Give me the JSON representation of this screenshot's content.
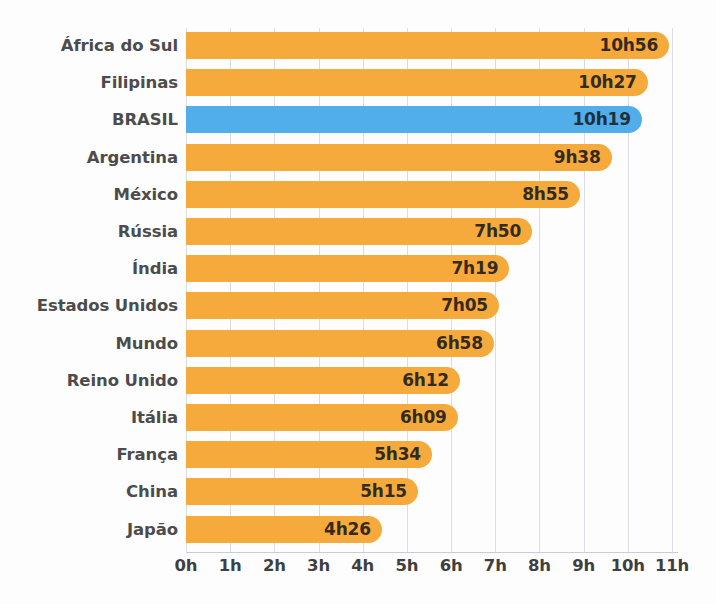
{
  "chart_data": {
    "type": "bar",
    "orientation": "horizontal",
    "title": "",
    "subtitle": "",
    "xlabel": "",
    "ylabel": "",
    "grid": true,
    "legend_position": "none",
    "xlim": [
      0,
      11
    ],
    "x_tick_labels": [
      "0h",
      "1h",
      "2h",
      "3h",
      "4h",
      "5h",
      "6h",
      "7h",
      "8h",
      "9h",
      "10h",
      "11h"
    ],
    "x_tick_values": [
      0,
      1,
      2,
      3,
      4,
      5,
      6,
      7,
      8,
      9,
      10,
      11
    ],
    "unit": "hours",
    "categories": [
      "África do Sul",
      "Filipinas",
      "BRASIL",
      "Argentina",
      "México",
      "Rússia",
      "Índia",
      "Estados Unidos",
      "Mundo",
      "Reino Unido",
      "Itália",
      "França",
      "China",
      "Japão"
    ],
    "values": [
      10.933,
      10.45,
      10.317,
      9.633,
      8.917,
      7.833,
      7.317,
      7.083,
      6.967,
      6.2,
      6.15,
      5.567,
      5.25,
      4.433
    ],
    "value_labels": [
      "10h56",
      "10h27",
      "10h19",
      "9h38",
      "8h55",
      "7h50",
      "7h19",
      "7h05",
      "6h58",
      "6h12",
      "6h09",
      "5h34",
      "5h15",
      "4h26"
    ],
    "highlight_index": 2,
    "bars": [
      {
        "category": "África do Sul",
        "value": 10.933,
        "label": "10h56",
        "color": "#f7aa3c",
        "highlight": false
      },
      {
        "category": "Filipinas",
        "value": 10.45,
        "label": "10h27",
        "color": "#f7aa3c",
        "highlight": false
      },
      {
        "category": "BRASIL",
        "value": 10.317,
        "label": "10h19",
        "color": "#52aeea",
        "highlight": true
      },
      {
        "category": "Argentina",
        "value": 9.633,
        "label": "9h38",
        "color": "#f7aa3c",
        "highlight": false
      },
      {
        "category": "México",
        "value": 8.917,
        "label": "8h55",
        "color": "#f7aa3c",
        "highlight": false
      },
      {
        "category": "Rússia",
        "value": 7.833,
        "label": "7h50",
        "color": "#f7aa3c",
        "highlight": false
      },
      {
        "category": "Índia",
        "value": 7.317,
        "label": "7h19",
        "color": "#f7aa3c",
        "highlight": false
      },
      {
        "category": "Estados Unidos",
        "value": 7.083,
        "label": "7h05",
        "color": "#f7aa3c",
        "highlight": false
      },
      {
        "category": "Mundo",
        "value": 6.967,
        "label": "6h58",
        "color": "#f7aa3c",
        "highlight": false
      },
      {
        "category": "Reino Unido",
        "value": 6.2,
        "label": "6h12",
        "color": "#f7aa3c",
        "highlight": false
      },
      {
        "category": "Itália",
        "value": 6.15,
        "label": "6h09",
        "color": "#f7aa3c",
        "highlight": false
      },
      {
        "category": "França",
        "value": 5.567,
        "label": "5h34",
        "color": "#f7aa3c",
        "highlight": false
      },
      {
        "category": "China",
        "value": 5.25,
        "label": "5h15",
        "color": "#f7aa3c",
        "highlight": false
      },
      {
        "category": "Japão",
        "value": 4.433,
        "label": "4h26",
        "color": "#f7aa3c",
        "highlight": false
      }
    ]
  },
  "colors": {
    "bar_default": "#f7aa3c",
    "bar_highlight": "#52aeea",
    "gridline": "#d9dde2",
    "category_text": "#4c4c4c",
    "tick_text": "#3f3f3f",
    "value_text": "#332b20",
    "background": "#fdfdfd"
  }
}
